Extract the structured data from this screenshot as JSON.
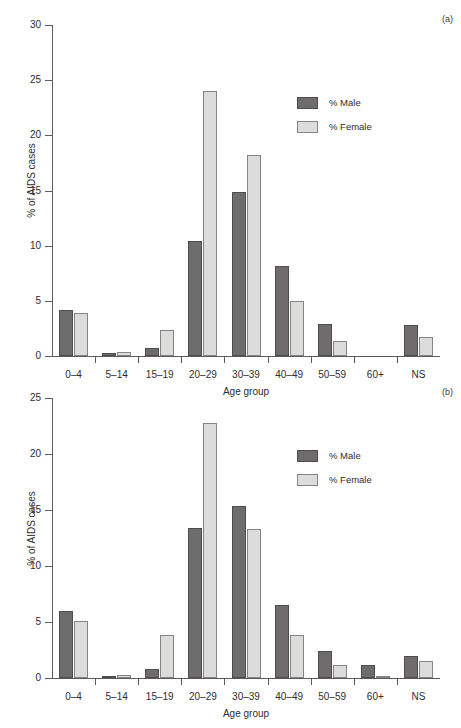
{
  "caption_sliver": "",
  "figures": [
    {
      "panel_label": "(a)",
      "legend": [
        {
          "key": "male",
          "label": "% Male",
          "color": "#6e6c6d"
        },
        {
          "key": "female",
          "label": "% Female",
          "color": "#dcdcda"
        }
      ],
      "chart_data": {
        "type": "bar",
        "title": "",
        "xlabel": "Age group",
        "ylabel": "% of AIDS cases",
        "ylim": [
          0,
          30
        ],
        "yticks": [
          0,
          5,
          10,
          15,
          20,
          25,
          30
        ],
        "grid": false,
        "legend_position": "upper right",
        "categories": [
          "0–4",
          "5–14",
          "15–19",
          "20–29",
          "30–39",
          "40–49",
          "50–59",
          "60+",
          "NS"
        ],
        "series": [
          {
            "name": "% Male",
            "color": "#6e6c6d",
            "values": [
              4.2,
              0.3,
              0.7,
              10.4,
              14.9,
              8.2,
              2.9,
              0,
              2.8
            ]
          },
          {
            "name": "% Female",
            "color": "#dcdcda",
            "values": [
              3.9,
              0.4,
              2.4,
              24.0,
              18.2,
              5.0,
              1.4,
              0,
              1.7
            ]
          }
        ]
      }
    },
    {
      "panel_label": "(b)",
      "legend": [
        {
          "key": "male",
          "label": "% Male",
          "color": "#6e6c6d"
        },
        {
          "key": "female",
          "label": "% Female",
          "color": "#dcdcda"
        }
      ],
      "chart_data": {
        "type": "bar",
        "title": "",
        "xlabel": "Age group",
        "ylabel": "% of AIDS cases",
        "ylim": [
          0,
          25
        ],
        "yticks": [
          0,
          5,
          10,
          15,
          20,
          25
        ],
        "grid": false,
        "legend_position": "upper right",
        "categories": [
          "0–4",
          "5–14",
          "15–19",
          "20–29",
          "30–39",
          "40–49",
          "50–59",
          "60+",
          "NS"
        ],
        "series": [
          {
            "name": "% Male",
            "color": "#6e6c6d",
            "values": [
              6.0,
              0.2,
              0.8,
              13.4,
              15.4,
              6.5,
              2.4,
              1.2,
              2.0
            ]
          },
          {
            "name": "% Female",
            "color": "#dcdcda",
            "values": [
              5.1,
              0.3,
              3.8,
              22.8,
              13.3,
              3.8,
              1.2,
              0.2,
              1.5
            ]
          }
        ]
      }
    }
  ]
}
